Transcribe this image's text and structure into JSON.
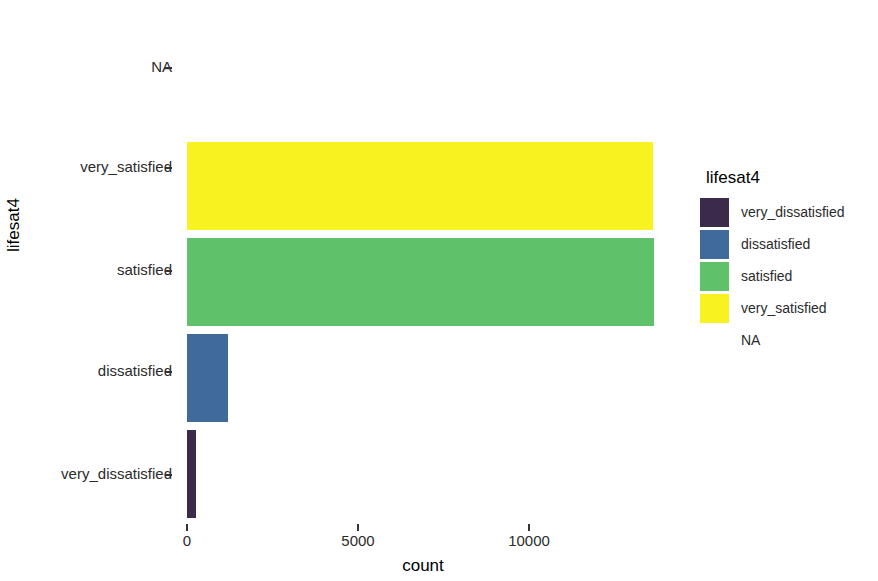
{
  "chart_data": {
    "type": "bar",
    "orientation": "horizontal",
    "title": "",
    "xlabel": "count",
    "ylabel": "lifesat4",
    "categories": [
      "very_dissatisfied",
      "dissatisfied",
      "satisfied",
      "very_satisfied",
      "NA"
    ],
    "values": [
      270,
      1200,
      13650,
      13630,
      0
    ],
    "series": [
      {
        "name": "lifesat4",
        "values": [
          270,
          1200,
          13650,
          13630,
          0
        ]
      }
    ],
    "xlim": [
      0,
      13800
    ],
    "ylim_categories": [
      "very_dissatisfied",
      "dissatisfied",
      "satisfied",
      "very_satisfied",
      "NA"
    ],
    "x_ticks": [
      0,
      5000,
      10000
    ],
    "x_tick_labels": [
      "0",
      "5000",
      "10000"
    ],
    "grid": false,
    "legend_position": "right",
    "legend_title": "lifesat4",
    "colors": {
      "very_dissatisfied": "#3B2A4A",
      "dissatisfied": "#40699C",
      "satisfied": "#5FC26A",
      "very_satisfied": "#F9F221",
      "NA": "#FFFFFF"
    }
  },
  "axes": {
    "y_title": "lifesat4",
    "x_title": "count",
    "y_tick_labels": [
      "NA",
      "very_satisfied",
      "satisfied",
      "dissatisfied",
      "very_dissatisfied"
    ],
    "x_tick_labels": [
      "0",
      "5000",
      "10000"
    ]
  },
  "legend": {
    "title": "lifesat4",
    "items": [
      {
        "label": "very_dissatisfied",
        "color": "#3B2A4A"
      },
      {
        "label": "dissatisfied",
        "color": "#40699C"
      },
      {
        "label": "satisfied",
        "color": "#5FC26A"
      },
      {
        "label": "very_satisfied",
        "color": "#F9F221"
      },
      {
        "label": "NA",
        "color": "#FFFFFF"
      }
    ]
  }
}
